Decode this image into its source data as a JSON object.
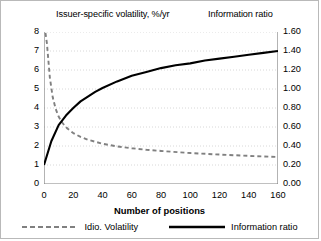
{
  "titles": {
    "left_axis_title": "Issuer-specific volatility, %/yr",
    "right_axis_title": "Information ratio",
    "x_axis_title": "Number of positions"
  },
  "legend": {
    "items": [
      {
        "label": "Idio. Volatility",
        "style": "dashed",
        "color": "#808080"
      },
      {
        "label": "Information ratio",
        "style": "solid",
        "color": "#000000"
      }
    ]
  },
  "colors": {
    "idio_volatility": "#808080",
    "information_ratio": "#000000",
    "gridline": "#d8d8d8",
    "axis": "#808080",
    "border": "#b9b9b9"
  },
  "axis_ticks": {
    "left": [
      "0",
      "1",
      "2",
      "3",
      "4",
      "5",
      "6",
      "7",
      "8"
    ],
    "right": [
      "0.00",
      "0.20",
      "0.40",
      "0.60",
      "0.80",
      "1.00",
      "1.20",
      "1.40",
      "1.60"
    ],
    "bottom": [
      "0",
      "20",
      "40",
      "60",
      "80",
      "100",
      "120",
      "140",
      "160"
    ]
  },
  "chart_data": {
    "type": "line",
    "title": "",
    "xlabel": "Number of positions",
    "ylabel": "Issuer-specific volatility, %/yr",
    "y2label": "Information ratio",
    "xlim": [
      0,
      160
    ],
    "ylim": [
      0,
      8
    ],
    "y2lim": [
      0.0,
      1.6
    ],
    "xticks": [
      0,
      20,
      40,
      60,
      80,
      100,
      120,
      140,
      160
    ],
    "yticks": [
      0,
      1,
      2,
      3,
      4,
      5,
      6,
      7,
      8
    ],
    "y2ticks": [
      0.0,
      0.2,
      0.4,
      0.6,
      0.8,
      1.0,
      1.2,
      1.4,
      1.6
    ],
    "grid": true,
    "legend_position": "bottom",
    "series": [
      {
        "name": "Idio. Volatility",
        "axis": "left",
        "style": "dashed",
        "color": "#808080",
        "x": [
          1,
          2,
          4,
          6,
          8,
          10,
          12,
          14,
          16,
          20,
          25,
          30,
          40,
          50,
          60,
          70,
          80,
          100,
          120,
          140,
          160
        ],
        "values": [
          7.95,
          7.4,
          5.6,
          4.55,
          3.95,
          3.55,
          3.28,
          3.08,
          2.92,
          2.68,
          2.48,
          2.33,
          2.12,
          1.98,
          1.88,
          1.8,
          1.74,
          1.63,
          1.55,
          1.48,
          1.42
        ]
      },
      {
        "name": "Information ratio",
        "axis": "right",
        "style": "solid",
        "color": "#000000",
        "x": [
          0,
          5,
          10,
          15,
          20,
          25,
          30,
          35,
          40,
          50,
          60,
          70,
          80,
          90,
          100,
          110,
          120,
          130,
          140,
          150,
          160
        ],
        "values": [
          0.2,
          0.45,
          0.62,
          0.72,
          0.8,
          0.87,
          0.92,
          0.97,
          1.01,
          1.08,
          1.14,
          1.18,
          1.22,
          1.25,
          1.27,
          1.3,
          1.32,
          1.34,
          1.36,
          1.38,
          1.4
        ]
      }
    ]
  }
}
